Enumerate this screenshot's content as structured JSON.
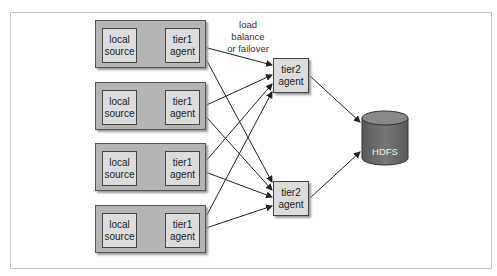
{
  "diagram": {
    "note": {
      "line1": "load balance",
      "line2": "or failover"
    },
    "tier1_groups": [
      {
        "source": {
          "line1": "local",
          "line2": "source"
        },
        "agent": {
          "line1": "tier1",
          "line2": "agent"
        }
      },
      {
        "source": {
          "line1": "local",
          "line2": "source"
        },
        "agent": {
          "line1": "tier1",
          "line2": "agent"
        }
      },
      {
        "source": {
          "line1": "local",
          "line2": "source"
        },
        "agent": {
          "line1": "tier1",
          "line2": "agent"
        }
      },
      {
        "source": {
          "line1": "local",
          "line2": "source"
        },
        "agent": {
          "line1": "tier1",
          "line2": "agent"
        }
      }
    ],
    "tier2_agents": [
      {
        "line1": "tier2",
        "line2": "agent"
      },
      {
        "line1": "tier2",
        "line2": "agent"
      }
    ],
    "sink": {
      "label": "HDFS"
    },
    "colors": {
      "group_fill": "#b4b4b4",
      "box_fill": "#dcdcdc",
      "cylinder": "#666666",
      "stroke": "#333333"
    }
  }
}
